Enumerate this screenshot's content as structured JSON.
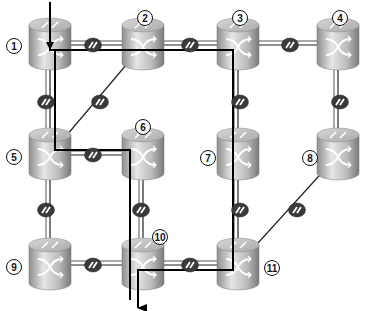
{
  "diagram": {
    "type": "network-topology",
    "colors": {
      "background": "#ffffff",
      "link": "#222222",
      "path": "#000000",
      "router_top": "#c9c9c9",
      "router_side": "#a8a8a8",
      "link_icon": "#3a3a3a"
    },
    "routers": [
      {
        "id": "1",
        "label": "1",
        "x": 50,
        "y": 45,
        "lx": 14,
        "ly": 46
      },
      {
        "id": "2",
        "label": "2",
        "x": 143,
        "y": 45,
        "lx": 145,
        "ly": 18
      },
      {
        "id": "3",
        "label": "3",
        "x": 238,
        "y": 45,
        "lx": 240,
        "ly": 18
      },
      {
        "id": "4",
        "label": "4",
        "x": 338,
        "y": 45,
        "lx": 340,
        "ly": 18
      },
      {
        "id": "5",
        "label": "5",
        "x": 50,
        "y": 155,
        "lx": 14,
        "ly": 157
      },
      {
        "id": "6",
        "label": "6",
        "x": 143,
        "y": 155,
        "lx": 143,
        "ly": 127
      },
      {
        "id": "7",
        "label": "7",
        "x": 238,
        "y": 155,
        "lx": 208,
        "ly": 158
      },
      {
        "id": "8",
        "label": "8",
        "x": 338,
        "y": 155,
        "lx": 310,
        "ly": 158
      },
      {
        "id": "9",
        "label": "9",
        "x": 50,
        "y": 265,
        "lx": 14,
        "ly": 267
      },
      {
        "id": "10",
        "label": "10",
        "x": 143,
        "y": 265,
        "lx": 160,
        "ly": 237
      },
      {
        "id": "11",
        "label": "11",
        "x": 238,
        "y": 265,
        "lx": 272,
        "ly": 268
      }
    ],
    "links": [
      {
        "from": "1",
        "to": "2",
        "icon_x": 93,
        "icon_y": 45
      },
      {
        "from": "2",
        "to": "3",
        "icon_x": 190,
        "icon_y": 45
      },
      {
        "from": "3",
        "to": "4",
        "icon_x": 290,
        "icon_y": 45
      },
      {
        "from": "1",
        "to": "5",
        "icon_x": 46,
        "icon_y": 102
      },
      {
        "from": "2",
        "to": "5",
        "icon_x": 100,
        "icon_y": 102
      },
      {
        "from": "3",
        "to": "7",
        "icon_x": 240,
        "icon_y": 102
      },
      {
        "from": "4",
        "to": "8",
        "icon_x": 340,
        "icon_y": 102
      },
      {
        "from": "5",
        "to": "6",
        "icon_x": 93,
        "icon_y": 155
      },
      {
        "from": "5",
        "to": "9",
        "icon_x": 46,
        "icon_y": 210
      },
      {
        "from": "6",
        "to": "10",
        "icon_x": 141,
        "icon_y": 210
      },
      {
        "from": "7",
        "to": "11",
        "icon_x": 240,
        "icon_y": 210
      },
      {
        "from": "8",
        "to": "11",
        "icon_x": 297,
        "icon_y": 210
      },
      {
        "from": "9",
        "to": "10",
        "icon_x": 93,
        "icon_y": 265
      },
      {
        "from": "10",
        "to": "11",
        "icon_x": 190,
        "icon_y": 265
      }
    ],
    "paths": [
      {
        "name": "path-via-3-7-11",
        "points": [
          [
            50,
            2
          ],
          [
            50,
            50
          ],
          [
            233,
            50
          ],
          [
            233,
            270
          ],
          [
            138,
            270
          ],
          [
            138,
            308
          ]
        ],
        "arrow_start": true,
        "arrow_end": true
      },
      {
        "name": "path-via-5-6-10",
        "points": [
          [
            55,
            50
          ],
          [
            55,
            150
          ],
          [
            130,
            150
          ],
          [
            130,
            300
          ]
        ],
        "arrow_start": false,
        "arrow_end": false
      }
    ]
  }
}
